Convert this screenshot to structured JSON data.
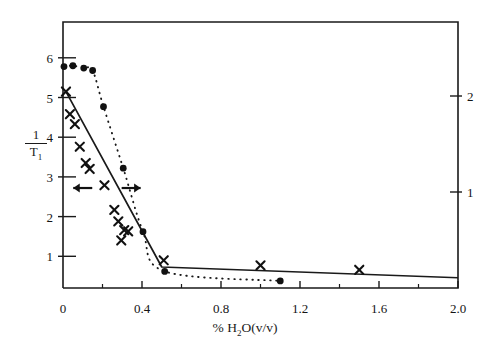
{
  "chart_data": {
    "type": "scatter",
    "title": "",
    "xlabel": "% H2O(v/v)",
    "xlabel_parts": {
      "pre": "% H",
      "sub": "2",
      "post": "O(v/v)"
    },
    "ylabel_left": {
      "numerator": "1",
      "denominator": "T",
      "denominator_sub": "1"
    },
    "ylabel_right": "",
    "xlim": [
      0,
      2.0
    ],
    "ylim_left": [
      0,
      6.7
    ],
    "ylim_right": [
      0,
      2.45
    ],
    "grid": false,
    "legend": "none",
    "x_ticks_major": [
      "0",
      "0.4",
      "0.8",
      "1.2",
      "1.6",
      "2.0"
    ],
    "x_tick_values": [
      0,
      0.4,
      0.8,
      1.2,
      1.6,
      2.0
    ],
    "x_minor_tick_values": [
      0.2,
      0.6,
      1.0,
      1.4,
      1.8
    ],
    "y_ticks_left": [
      "1",
      "2",
      "3",
      "4",
      "5",
      "6"
    ],
    "y_tick_left_values": [
      1,
      2,
      3,
      4,
      5,
      6
    ],
    "y_ticks_right": [
      "1",
      "2"
    ],
    "y_tick_right_values": [
      1,
      2
    ],
    "series": [
      {
        "name": "cross-series",
        "marker": "x",
        "line_style": "solid",
        "axis": "left",
        "points": [
          [
            0.015,
            5.15
          ],
          [
            0.035,
            4.58
          ],
          [
            0.06,
            4.33
          ],
          [
            0.085,
            3.76
          ],
          [
            0.115,
            3.35
          ],
          [
            0.135,
            3.2
          ],
          [
            0.21,
            2.79
          ],
          [
            0.26,
            2.17
          ],
          [
            0.28,
            1.88
          ],
          [
            0.295,
            1.4
          ],
          [
            0.31,
            1.66
          ],
          [
            0.33,
            1.63
          ],
          [
            0.51,
            0.9
          ],
          [
            1.0,
            0.77
          ],
          [
            1.5,
            0.66
          ]
        ],
        "fit_line": [
          [
            0.015,
            5.15
          ],
          [
            0.5,
            0.73
          ],
          [
            2.0,
            0.46
          ]
        ]
      },
      {
        "name": "filled-circle-series",
        "marker": "filled-circle",
        "line_style": "dotted",
        "axis": "right",
        "points": [
          [
            0.005,
            5.78
          ],
          [
            0.05,
            5.8
          ],
          [
            0.105,
            5.74
          ],
          [
            0.15,
            5.68
          ],
          [
            0.205,
            4.77
          ],
          [
            0.305,
            3.22
          ],
          [
            0.405,
            1.62
          ],
          [
            0.515,
            0.62
          ],
          [
            1.1,
            0.38
          ]
        ]
      }
    ],
    "annotations": [
      {
        "name": "left-arrow",
        "symbol": "arrow-left",
        "x": 0.1,
        "y": 2.72
      },
      {
        "name": "right-arrow",
        "symbol": "arrow-right",
        "x": 0.345,
        "y": 2.72
      }
    ]
  },
  "axes": {
    "x_labels": [
      {
        "text": "0",
        "x": 0.0
      },
      {
        "text": "0.4",
        "x": 0.4
      },
      {
        "text": "0.8",
        "x": 0.8
      },
      {
        "text": "1.2",
        "x": 1.2
      },
      {
        "text": "1.6",
        "x": 1.6
      },
      {
        "text": "2.0",
        "x": 2.0
      }
    ],
    "y_left_labels": [
      {
        "text": "6",
        "y": 6
      },
      {
        "text": "5",
        "y": 5
      },
      {
        "text": "4",
        "y": 4
      },
      {
        "text": "3",
        "y": 3
      },
      {
        "text": "2",
        "y": 2
      },
      {
        "text": "1",
        "y": 1
      }
    ],
    "y_right_labels": [
      {
        "text": "2",
        "y": 2
      },
      {
        "text": "1",
        "y": 1
      }
    ]
  }
}
